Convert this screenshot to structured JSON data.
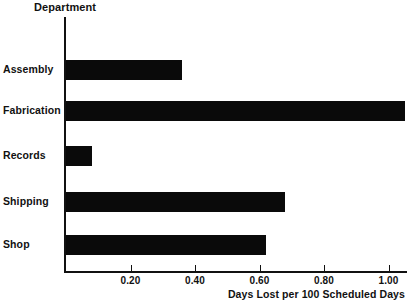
{
  "chart_data": {
    "type": "bar",
    "orientation": "horizontal",
    "title": "",
    "ylabel": "Department",
    "xlabel": "Days Lost per 100 Scheduled Days",
    "categories": [
      "Assembly",
      "Fabrication",
      "Records",
      "Shipping",
      "Shop"
    ],
    "values": [
      0.36,
      1.05,
      0.08,
      0.68,
      0.62
    ],
    "xlim": [
      0,
      1.13
    ],
    "xticks": [
      0.2,
      0.4,
      0.6,
      0.8,
      1.0
    ],
    "xtick_labels": [
      "0.20",
      "0.40",
      "0.60",
      "0.80",
      "1.00"
    ],
    "grid": false,
    "legend": null,
    "bar_color": "#0a0a0a",
    "axis_color": "#111111",
    "background": "#ffffff"
  },
  "axes": {
    "y_axis_title": "Department",
    "x_axis_title": "Days Lost per 100 Scheduled Days"
  },
  "bars": [
    {
      "label": "Assembly",
      "value": 0.36
    },
    {
      "label": "Fabrication",
      "value": 1.05
    },
    {
      "label": "Records",
      "value": 0.08
    },
    {
      "label": "Shipping",
      "value": 0.68
    },
    {
      "label": "Shop",
      "value": 0.62
    }
  ],
  "ticks": [
    {
      "label": "0.20",
      "value": 0.2
    },
    {
      "label": "0.40",
      "value": 0.4
    },
    {
      "label": "0.60",
      "value": 0.6
    },
    {
      "label": "0.80",
      "value": 0.8
    },
    {
      "label": "1.00",
      "value": 1.0
    }
  ]
}
